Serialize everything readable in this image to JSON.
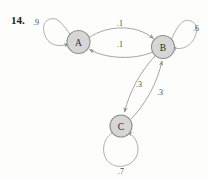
{
  "figure": {
    "number": "14.",
    "type": "markov-chain-state-diagram",
    "background_color": "#fdfdfc"
  },
  "nodes": [
    {
      "id": "A",
      "label": "A",
      "cx": 78.5,
      "cy": 42,
      "r": 11.5,
      "fill": "#d6d6d6",
      "stroke": "#8e8e8e"
    },
    {
      "id": "B",
      "label": "B",
      "cx": 163,
      "cy": 47,
      "r": 11.5,
      "fill": "#d6d6d6",
      "stroke": "#8e8e8e"
    },
    {
      "id": "C",
      "label": "C",
      "cx": 121,
      "cy": 126,
      "r": 11,
      "fill": "#d6d6d6",
      "stroke": "#8e8e8e"
    }
  ],
  "edges": [
    {
      "from": "A",
      "to": "A",
      "label": ".9",
      "kind": "self-loop",
      "label_x": 36,
      "label_y": 22
    },
    {
      "from": "A",
      "to": "B",
      "label": ".1",
      "kind": "curve",
      "label_x": 120,
      "label_y": 23
    },
    {
      "from": "B",
      "to": "A",
      "label": ".1",
      "kind": "curve",
      "label_x": 120,
      "label_y": 44
    },
    {
      "from": "B",
      "to": "B",
      "label": ".6",
      "kind": "self-loop",
      "label_x": 196,
      "label_y": 28
    },
    {
      "from": "B",
      "to": "C",
      "label": ".3",
      "kind": "curve",
      "label_x": 139,
      "label_y": 84
    },
    {
      "from": "C",
      "to": "B",
      "label": ".3",
      "kind": "curve",
      "label_x": 160,
      "label_y": 92
    },
    {
      "from": "C",
      "to": "C",
      "label": ".7",
      "kind": "self-loop",
      "label_x": 121,
      "label_y": 171
    }
  ],
  "colors": {
    "node_fill": "#d6d6d6",
    "node_stroke": "#8e8e8e",
    "edge_stroke": "#9a9a9a",
    "text": "#2a2a2a"
  }
}
